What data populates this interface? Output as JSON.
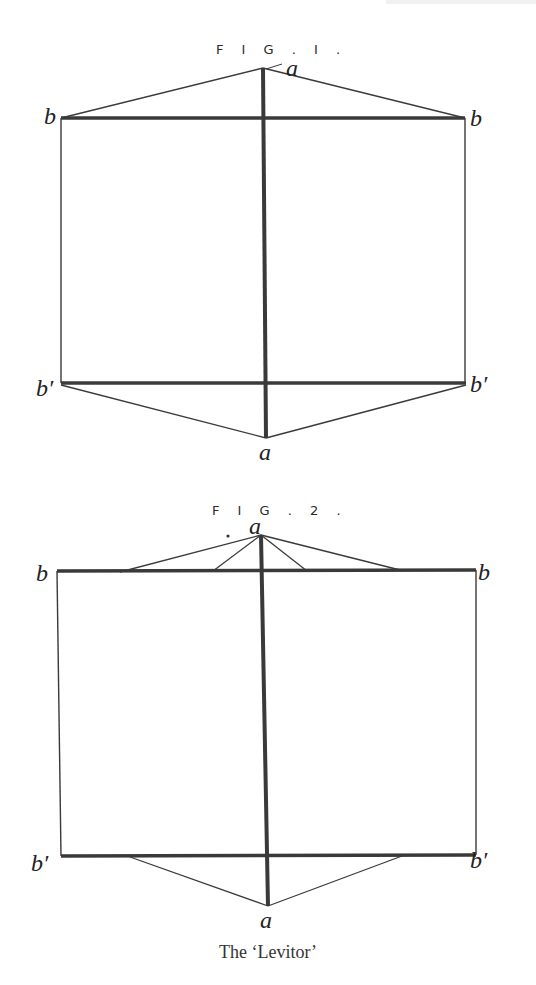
{
  "figures": [
    {
      "title": "F I G . I .",
      "labels": {
        "top": "a",
        "top_left": "b",
        "top_right": "b",
        "bottom_left": "b′",
        "bottom_right": "b′",
        "bottom": "a"
      }
    },
    {
      "title": "F I G . 2 .",
      "labels": {
        "top": "a",
        "top_left": "b",
        "top_right": "b",
        "bottom_left": "b′",
        "bottom_right": "b′",
        "bottom": "a"
      }
    }
  ],
  "caption": "The ‘Levitor’"
}
